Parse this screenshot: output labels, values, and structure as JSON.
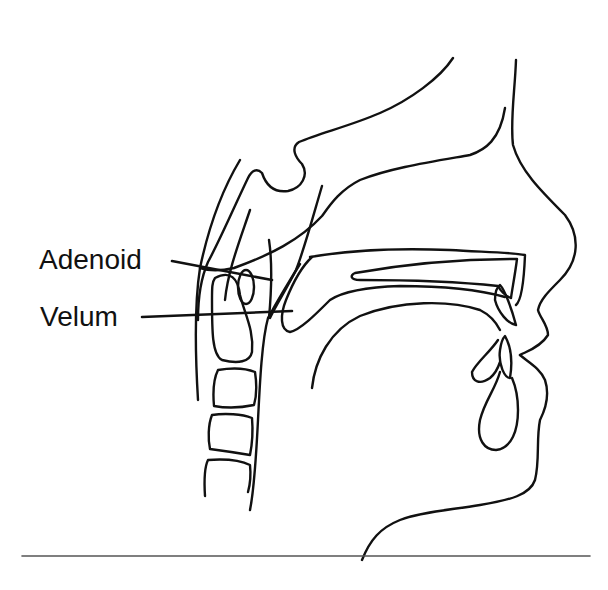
{
  "figure": {
    "type": "sagittal head and neck anatomical line drawing",
    "labels": [
      {
        "id": "adenoid",
        "text": "Adenoid"
      },
      {
        "id": "velum",
        "text": "Velum"
      }
    ],
    "colors": {
      "line": "#111111",
      "background": "#ffffff",
      "rule": "#555555"
    }
  }
}
